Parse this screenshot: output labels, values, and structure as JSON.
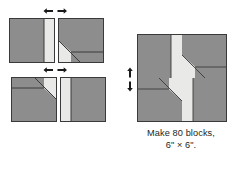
{
  "diagram": {
    "colors": {
      "fabric_dark": "#8d8d8d",
      "fabric_light": "#e9e9e7",
      "outline": "#3a3a3a",
      "arrow": "#1a1a1a",
      "background": "#ffffff",
      "text": "#231f20"
    },
    "caption": {
      "line1": "Make 80 blocks,",
      "line2": "6\" × 6\"."
    },
    "steps": [
      {
        "id": "step-1",
        "name": "top-row-units",
        "units": [
          {
            "id": "unit-strip-right",
            "label": "dark square with light strip on right edge"
          },
          {
            "id": "unit-diagonal-a",
            "label": "dark square with light diagonal triangle and light bottom strip"
          }
        ],
        "join_arrows": {
          "name": "join-horizontal-arrows",
          "direction": "horizontal-outward",
          "count": 2
        }
      },
      {
        "id": "step-2",
        "name": "bottom-row-units",
        "units": [
          {
            "id": "unit-diagonal-b",
            "label": "dark square with light diagonal triangle and light top strip, rotated"
          },
          {
            "id": "unit-strip-left",
            "label": "dark square with light strip on left edge"
          }
        ],
        "join_arrows": {
          "name": "join-horizontal-arrows",
          "direction": "horizontal-outward",
          "count": 2
        }
      },
      {
        "id": "step-3",
        "name": "assembled-block",
        "label": "Completed pinwheel block, four quadrants",
        "quadrants": [
          {
            "id": "quadrant-top-left",
            "label": "dark square with light strip on right edge"
          },
          {
            "id": "quadrant-top-right",
            "label": "dark square with light diagonal and light strip"
          },
          {
            "id": "quadrant-bottom-left",
            "label": "dark square with light diagonal and light strip rotated"
          },
          {
            "id": "quadrant-bottom-right",
            "label": "dark square with light strip on left edge"
          }
        ],
        "join_arrows": {
          "name": "join-vertical-arrows",
          "direction": "vertical-outward",
          "count": 2
        }
      }
    ]
  }
}
